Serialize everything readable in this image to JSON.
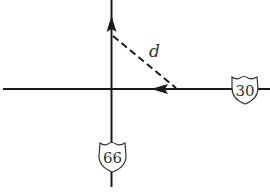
{
  "diagram": {
    "distance_label": "d",
    "highways": [
      {
        "name": "highway-30",
        "number": "30",
        "orientation": "horizontal",
        "direction": "west"
      },
      {
        "name": "highway-66",
        "number": "66",
        "orientation": "vertical",
        "direction": "north"
      }
    ],
    "colors": {
      "line": "#1a1a1a",
      "background": "#ffffff"
    }
  }
}
